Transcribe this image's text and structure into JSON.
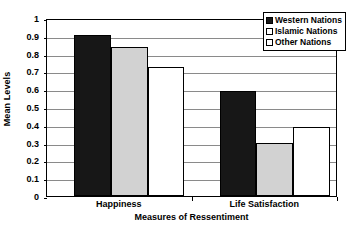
{
  "chart_data": {
    "type": "bar",
    "title": "",
    "xlabel": "Measures of Ressentiment",
    "ylabel": "Mean Levels",
    "categories": [
      "Happiness",
      "Life Satisfaction"
    ],
    "series": [
      {
        "name": "Western Nations",
        "color": "#171717",
        "values": [
          0.905,
          0.59
        ]
      },
      {
        "name": "Islamic Nations",
        "color": "#d2d2d2",
        "values": [
          0.835,
          0.3
        ]
      },
      {
        "name": "Other Nations",
        "color": "#ffffff",
        "values": [
          0.725,
          0.385
        ]
      }
    ],
    "ylim": [
      0,
      1
    ],
    "ytick_values": [
      0,
      0.1,
      0.2,
      0.3,
      0.4,
      0.5,
      0.6,
      0.7,
      0.8,
      0.9,
      1
    ],
    "ytick_labels": [
      "0",
      "0.1",
      "0.2",
      "0.3",
      "0.4",
      "0.5",
      "0.6",
      "0.7",
      "0.8",
      "0.9",
      "1"
    ],
    "grid": true,
    "grid_axis": "y",
    "legend_position": "top-right",
    "legend_entries": [
      "Western Nations",
      "Islamic Nations",
      "Other Nations"
    ]
  }
}
